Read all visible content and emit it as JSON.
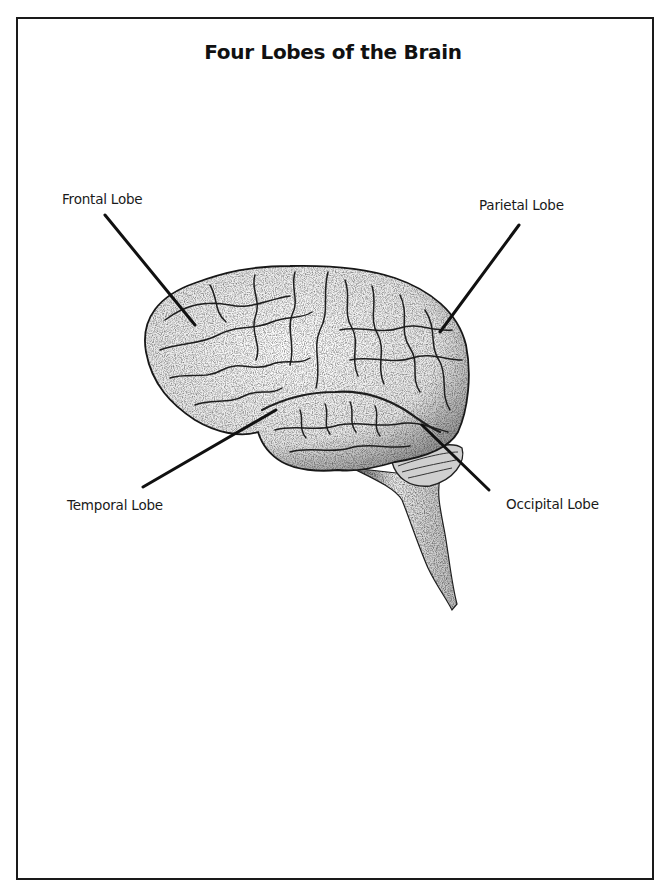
{
  "diagram": {
    "title": "Four Lobes of the Brain",
    "labels": {
      "frontal": "Frontal Lobe",
      "parietal": "Parietal Lobe",
      "temporal": "Temporal Lobe",
      "occipital": "Occipital Lobe"
    },
    "colors": {
      "ink": "#1a1a1a",
      "background": "#ffffff"
    }
  }
}
